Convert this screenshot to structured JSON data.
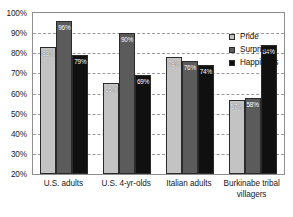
{
  "chart_data": {
    "type": "bar",
    "title": "",
    "subtitle": "",
    "xlabel": "",
    "ylabel": "",
    "ylim": [
      20,
      100
    ],
    "ytick_labels": [
      "100%",
      "90%",
      "80%",
      "70%",
      "60%",
      "50%",
      "40%",
      "30%",
      "20%"
    ],
    "ytick_values": [
      100,
      90,
      80,
      70,
      60,
      50,
      40,
      30,
      20
    ],
    "grid": true,
    "grid_axis": "y",
    "legend_position": "top-right",
    "categories": [
      "U.S. adults",
      "U.S. 4-yr-olds",
      "Italian adults",
      "Burkinabe tribal villagers"
    ],
    "series": [
      {
        "name": "Pride",
        "color": "#c3c3c3",
        "values": [
          83,
          65,
          78,
          57
        ],
        "labels": [
          "83%",
          "65%",
          "78%",
          "57%"
        ]
      },
      {
        "name": "Surprise",
        "color": "#5b5b5b",
        "values": [
          96,
          90,
          76,
          58
        ],
        "labels": [
          "96%",
          "90%",
          "76%",
          "58%"
        ]
      },
      {
        "name": "Happiness",
        "color": "#101010",
        "values": [
          79,
          69,
          74,
          84
        ],
        "labels": [
          "79%",
          "69%",
          "74%",
          "84%"
        ]
      }
    ]
  },
  "axis": {
    "y_ticks": [
      {
        "label": "100%",
        "value": 100
      },
      {
        "label": "90%",
        "value": 90
      },
      {
        "label": "80%",
        "value": 80
      },
      {
        "label": "70%",
        "value": 70
      },
      {
        "label": "60%",
        "value": 60
      },
      {
        "label": "50%",
        "value": 50
      },
      {
        "label": "40%",
        "value": 40
      },
      {
        "label": "30%",
        "value": 30
      },
      {
        "label": "20%",
        "value": 20
      }
    ],
    "categories": [
      {
        "line1": "U.S. adults",
        "line2": ""
      },
      {
        "line1": "U.S. 4-yr-olds",
        "line2": ""
      },
      {
        "line1": "Italian adults",
        "line2": ""
      },
      {
        "line1": "Burkinabe tribal",
        "line2": "villagers"
      }
    ]
  },
  "legend": {
    "items": [
      {
        "label": "Pride",
        "key": "pride"
      },
      {
        "label": "Surprise",
        "key": "surprise"
      },
      {
        "label": "Happiness",
        "key": "happiness"
      }
    ]
  }
}
